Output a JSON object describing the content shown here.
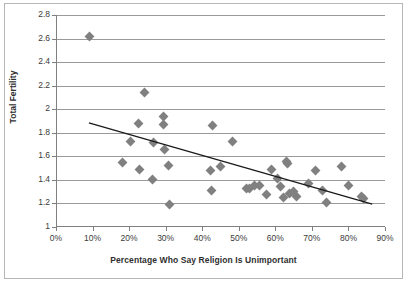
{
  "chart_data": {
    "type": "scatter",
    "title": "",
    "xlabel": "Percentage Who Say Religion Is Unimportant",
    "ylabel": "Total Fertility",
    "xlim": [
      0,
      90
    ],
    "ylim": [
      1,
      2.8
    ],
    "xtick_labels": [
      "0%",
      "10%",
      "20%",
      "30%",
      "40%",
      "50%",
      "60%",
      "70%",
      "80%",
      "90%"
    ],
    "xtick_values": [
      0,
      10,
      20,
      30,
      40,
      50,
      60,
      70,
      80,
      90
    ],
    "ytick_labels": [
      "1",
      "1.2",
      "1.4",
      "1.6",
      "1.8",
      "2",
      "2.2",
      "2.4",
      "2.6",
      "2.8"
    ],
    "ytick_values": [
      1,
      1.2,
      1.4,
      1.6,
      1.8,
      2,
      2.2,
      2.4,
      2.6,
      2.8
    ],
    "grid": "horizontal",
    "legend": "none",
    "marker_shape": "diamond",
    "marker_color": "#808080",
    "trendline_color": "#1a1a1a",
    "trendline": {
      "x0": 9.0,
      "y0": 1.885,
      "x1": 86.5,
      "y1": 1.195
    },
    "points": [
      {
        "x": 9.3,
        "y": 2.62
      },
      {
        "x": 24.3,
        "y": 2.14
      },
      {
        "x": 29.5,
        "y": 1.94
      },
      {
        "x": 29.4,
        "y": 1.87
      },
      {
        "x": 22.5,
        "y": 1.88
      },
      {
        "x": 42.8,
        "y": 1.86
      },
      {
        "x": 20.3,
        "y": 1.73
      },
      {
        "x": 48.2,
        "y": 1.73
      },
      {
        "x": 26.8,
        "y": 1.72
      },
      {
        "x": 29.6,
        "y": 1.66
      },
      {
        "x": 18.1,
        "y": 1.55
      },
      {
        "x": 63.0,
        "y": 1.56
      },
      {
        "x": 63.3,
        "y": 1.54
      },
      {
        "x": 30.7,
        "y": 1.52
      },
      {
        "x": 45.0,
        "y": 1.51
      },
      {
        "x": 78.0,
        "y": 1.51
      },
      {
        "x": 22.9,
        "y": 1.49
      },
      {
        "x": 59.0,
        "y": 1.49
      },
      {
        "x": 42.2,
        "y": 1.48
      },
      {
        "x": 71.0,
        "y": 1.48
      },
      {
        "x": 26.4,
        "y": 1.4
      },
      {
        "x": 60.6,
        "y": 1.41
      },
      {
        "x": 69.0,
        "y": 1.37
      },
      {
        "x": 80.0,
        "y": 1.355
      },
      {
        "x": 54.3,
        "y": 1.355
      },
      {
        "x": 55.8,
        "y": 1.35
      },
      {
        "x": 61.5,
        "y": 1.34
      },
      {
        "x": 52.1,
        "y": 1.325
      },
      {
        "x": 53.0,
        "y": 1.33
      },
      {
        "x": 42.5,
        "y": 1.31
      },
      {
        "x": 73.0,
        "y": 1.31
      },
      {
        "x": 57.5,
        "y": 1.275
      },
      {
        "x": 65.8,
        "y": 1.255
      },
      {
        "x": 62.2,
        "y": 1.25
      },
      {
        "x": 63.8,
        "y": 1.285
      },
      {
        "x": 65.0,
        "y": 1.3
      },
      {
        "x": 83.5,
        "y": 1.26
      },
      {
        "x": 84.2,
        "y": 1.24
      },
      {
        "x": 74.0,
        "y": 1.21
      },
      {
        "x": 31.0,
        "y": 1.195
      }
    ]
  }
}
